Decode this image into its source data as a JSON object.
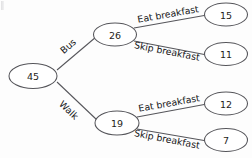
{
  "diagram": {
    "type": "tree",
    "background_color": "#fdfdfd",
    "stroke_color": "#55555a",
    "text_color": "#1d1d20",
    "root": {
      "label": "45",
      "name": "root-node"
    },
    "level1": [
      {
        "label": "26",
        "edge_label": "Bus",
        "name": "bus-node"
      },
      {
        "label": "19",
        "edge_label": "Walk",
        "name": "walk-node"
      }
    ],
    "level2": [
      {
        "label": "15",
        "edge_label": "Eat breakfast",
        "parent": "26",
        "name": "bus-eat-node"
      },
      {
        "label": "11",
        "edge_label": "Skip breakfast",
        "parent": "26",
        "name": "bus-skip-node"
      },
      {
        "label": "12",
        "edge_label": "Eat breakfast",
        "parent": "19",
        "name": "walk-eat-node"
      },
      {
        "label": "7",
        "edge_label": "Skip breakfast",
        "parent": "19",
        "name": "walk-skip-node"
      }
    ]
  }
}
